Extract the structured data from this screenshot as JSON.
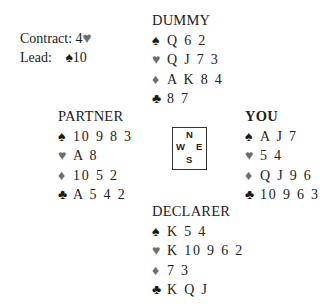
{
  "info": {
    "contract_label": "Contract: 4",
    "contract_suit": "♥",
    "lead_label": "Lead:",
    "lead_suit": "♠",
    "lead_card": "10"
  },
  "suits": {
    "spades": "♠",
    "hearts": "♥",
    "diamonds": "♦",
    "clubs": "♣"
  },
  "colors": {
    "black_suits": "#1a1a1a",
    "red_suits_rendered_grey": "#6e6e6e"
  },
  "hands": {
    "north": {
      "title": "DUMMY",
      "spades": "Q 6 2",
      "hearts": "Q J 7 3",
      "diamonds": "A K 8 4",
      "clubs": "8 7"
    },
    "west": {
      "title": "PARTNER",
      "spades": "10 9 8 3",
      "hearts": "A 8",
      "diamonds": "10 5 2",
      "clubs": "A 5 4 2"
    },
    "east": {
      "title": "YOU",
      "spades": "A J 7",
      "hearts": "5 4",
      "diamonds": "Q J 9 6",
      "clubs": "10 9 6 3"
    },
    "south": {
      "title": "DECLARER",
      "spades": "K 5 4",
      "hearts": "K 10 9 6 2",
      "diamonds": "7 3",
      "clubs": "K Q J"
    }
  },
  "compass": {
    "n": "N",
    "w": "W",
    "e": "E",
    "s": "S"
  }
}
